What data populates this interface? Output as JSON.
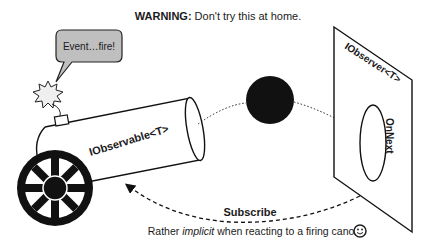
{
  "title": {
    "bold": "WARNING:",
    "rest": " Don't try this at home."
  },
  "speech_bubble": {
    "text": "Event…fire!",
    "fill": "#bfbfbf"
  },
  "cannon": {
    "label": "IObservable<T>"
  },
  "observer_panel": {
    "label": "IObserver<T>",
    "method": "OnNext"
  },
  "arrows": {
    "subscribe_label": "Subscribe"
  },
  "caption": {
    "prefix": "Rather ",
    "emphasis": "implicit",
    "suffix": " when reacting to a firing canon",
    "icon": "smiley-icon"
  }
}
